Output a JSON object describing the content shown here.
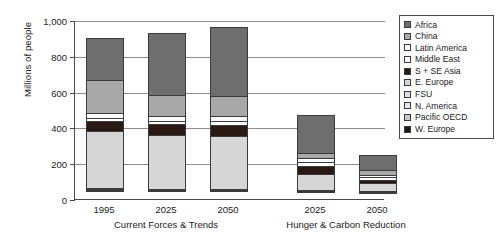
{
  "chart_data": {
    "type": "bar",
    "subtype": "stacked-bar-grouped",
    "title": "",
    "xlabel": "",
    "ylabel": "Millions of people",
    "ylim": [
      0,
      1000
    ],
    "yticks": [
      0,
      200,
      400,
      600,
      800,
      1000
    ],
    "ytick_labels": [
      "0",
      "200",
      "400",
      "600",
      "800",
      "1,000"
    ],
    "grid": true,
    "legend_position": "right",
    "groups": [
      {
        "label": "Current Forces & Trends",
        "categories": [
          "1995",
          "2025",
          "2050"
        ]
      },
      {
        "label": "Hunger & Carbon Reduction",
        "categories": [
          "2025",
          "2050"
        ]
      }
    ],
    "categories": [
      "1995",
      "2025",
      "2050",
      "2025",
      "2050"
    ],
    "series": [
      {
        "name": "W. Europe",
        "color": "#1a1a1a",
        "values": [
          12,
          10,
          10,
          8,
          6
        ]
      },
      {
        "name": "Pacific OECD",
        "color": "#c9c9c9",
        "values": [
          8,
          6,
          6,
          5,
          4
        ]
      },
      {
        "name": "N. America",
        "color": "#e8e8e8",
        "values": [
          6,
          5,
          5,
          4,
          3
        ]
      },
      {
        "name": "FSU",
        "color": "#e0e0e0",
        "values": [
          8,
          6,
          6,
          5,
          4
        ]
      },
      {
        "name": "E. Europe",
        "color": "#d6d6d6",
        "values": [
          326,
          310,
          305,
          96,
          52
        ]
      },
      {
        "name": "S + SE Asia",
        "color": "#2b1a14",
        "values": [
          58,
          62,
          62,
          50,
          22
        ]
      },
      {
        "name": "Middle East",
        "color": "#ffffff",
        "values": [
          22,
          25,
          26,
          28,
          18
        ]
      },
      {
        "name": "Latin America",
        "color": "#fcfcfc",
        "values": [
          30,
          32,
          34,
          22,
          14
        ]
      },
      {
        "name": "China",
        "color": "#a8a8a8",
        "values": [
          192,
          121,
          116,
          36,
          36
        ]
      },
      {
        "name": "Africa",
        "color": "#6e6e6e",
        "values": [
          238,
          350,
          392,
          215,
          86
        ]
      }
    ],
    "totals": [
      900,
      927,
      962,
      469,
      245
    ]
  },
  "legend": {
    "entries": [
      {
        "label": "Africa",
        "color": "#6e6e6e"
      },
      {
        "label": "China",
        "color": "#a8a8a8"
      },
      {
        "label": "Latin America",
        "color": "#fcfcfc"
      },
      {
        "label": "Middle East",
        "color": "#ffffff"
      },
      {
        "label": "S + SE Asia",
        "color": "#2b1a14"
      },
      {
        "label": "E. Europe",
        "color": "#d6d6d6"
      },
      {
        "label": "FSU",
        "color": "#e0e0e0"
      },
      {
        "label": "N. America",
        "color": "#e8e8e8"
      },
      {
        "label": "Pacific OECD",
        "color": "#c9c9c9"
      },
      {
        "label": "W. Europe",
        "color": "#1a1a1a"
      }
    ]
  }
}
